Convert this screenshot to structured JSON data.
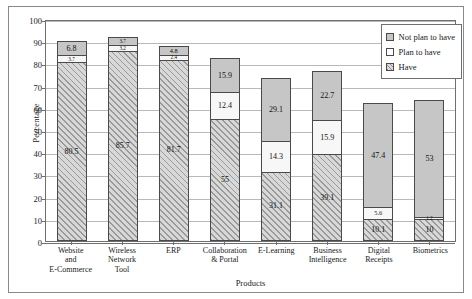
{
  "chart_data": {
    "type": "bar",
    "stacked": true,
    "title": "",
    "xlabel": "Products",
    "ylabel": "Percentage",
    "ylim": [
      0,
      100
    ],
    "yticks": [
      0,
      10,
      20,
      30,
      40,
      50,
      60,
      70,
      80,
      90,
      100
    ],
    "grid": true,
    "legend_position": "top-right",
    "categories": [
      "Website and E-Commerce",
      "Wireless Network Tool",
      "ERP",
      "Collaboration & Portal",
      "E-Learning",
      "Business Intelligence",
      "Digital Receipts",
      "Biometrics"
    ],
    "category_lines": [
      [
        "Website",
        "and",
        "E-Commerce"
      ],
      [
        "Wireless",
        "Network",
        "Tool"
      ],
      [
        "ERP"
      ],
      [
        "Collaboration",
        "& Portal"
      ],
      [
        "E-Learning"
      ],
      [
        "Business",
        "Intelligence"
      ],
      [
        "Digital",
        "Receipts"
      ],
      [
        "Biometrics"
      ]
    ],
    "series": [
      {
        "name": "Have",
        "values": [
          80.5,
          85.7,
          81.7,
          55,
          31.1,
          39.1,
          10.1,
          10
        ]
      },
      {
        "name": "Plan to have",
        "values": [
          3.7,
          3.2,
          2.4,
          12.4,
          14.3,
          15.9,
          5.6,
          1.2
        ]
      },
      {
        "name": "Not plan to have",
        "values": [
          6.8,
          3.7,
          4.8,
          15.9,
          29.1,
          22.7,
          47.4,
          53
        ]
      }
    ],
    "totals": [
      91.0,
      92.6,
      88.9,
      83.3,
      74.5,
      77.7,
      63.1,
      64.2
    ],
    "colors": {
      "have": "#c9c9c9",
      "plan": "#f7f7f7",
      "notplan": "#c6c6c6",
      "grid": "#b9b9b9",
      "axis": "#6f6f6f",
      "text": "#1a1a1a"
    }
  },
  "legend": {
    "items": [
      {
        "label": "Not plan to have",
        "key": "notplan"
      },
      {
        "label": "Plan to have",
        "key": "plan"
      },
      {
        "label": "Have",
        "key": "have"
      }
    ]
  }
}
